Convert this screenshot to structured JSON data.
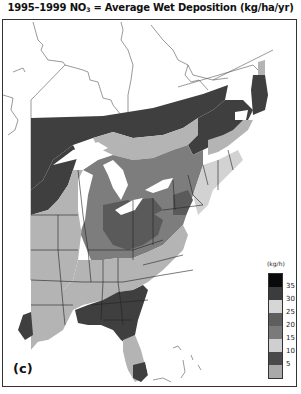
{
  "title": {
    "prefix": "1995–1999 NO",
    "subscript": "3",
    "suffix": " = Average Wet Deposition (kg/ha/yr)"
  },
  "panel_label": "(c)",
  "legend": {
    "unit": "(kg/h)",
    "swatches": [
      {
        "color": "#0a0a0a",
        "label": ""
      },
      {
        "color": "#3c3c3c",
        "label": "35"
      },
      {
        "color": "#d6d6d6",
        "label": "30"
      },
      {
        "color": "#5e5e5e",
        "label": "25"
      },
      {
        "color": "#7a7a7a",
        "label": "20"
      },
      {
        "color": "#cfcfcf",
        "label": "15"
      },
      {
        "color": "#4a4a4a",
        "label": "10"
      },
      {
        "color": "#a9a9a9",
        "label": "5"
      }
    ],
    "tick_labels": [
      "35",
      "30",
      "25",
      "20",
      "15",
      "10",
      "5"
    ]
  },
  "map": {
    "region": "Eastern United States and southeastern Canada",
    "variable": "NO3 average wet deposition",
    "period": "1995–1999",
    "units": "kg/ha/yr",
    "colors": {
      "band_very_high": "#3f3f3f",
      "band_high": "#5a5a5a",
      "band_mid": "#7d7d7d",
      "band_low": "#b4b4b4",
      "band_light": "#d2d2d2",
      "water": "#ffffff",
      "border": "#222222"
    }
  }
}
